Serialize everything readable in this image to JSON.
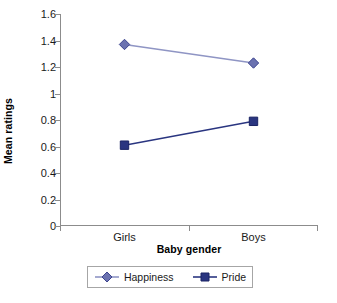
{
  "chart_data": {
    "type": "line",
    "title": "",
    "xlabel": "Baby gender",
    "ylabel": "Mean ratings",
    "categories": [
      "Girls",
      "Boys"
    ],
    "series": [
      {
        "name": "Happiness",
        "values": [
          1.37,
          1.23
        ],
        "color": "#6b72b0",
        "line_color": "#8f95c4",
        "marker": "diamond"
      },
      {
        "name": "Pride",
        "values": [
          0.61,
          0.79
        ],
        "color": "#2a3580",
        "line_color": "#2a3580",
        "marker": "square"
      }
    ],
    "ylim": [
      0,
      1.6
    ],
    "yticks": [
      "0",
      "0.2",
      "0.4",
      "0.6",
      "0.8",
      "1",
      "1.2",
      "1.4",
      "1.6"
    ],
    "ytick_values": [
      0,
      0.2,
      0.4,
      0.6,
      0.8,
      1.0,
      1.2,
      1.4,
      1.6
    ],
    "grid": false,
    "legend_position": "bottom",
    "axis_color": "#8c8c8c",
    "background": "#ffffff"
  }
}
